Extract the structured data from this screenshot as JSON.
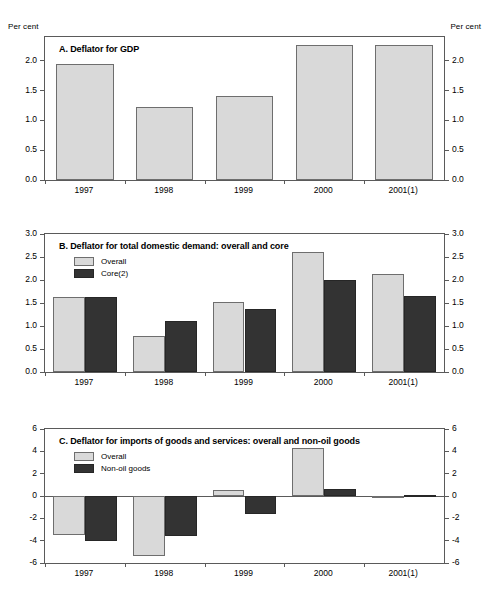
{
  "figure": {
    "unit_label_left": "Per cent",
    "unit_label_right": "Per cent"
  },
  "colors": {
    "series_light": "#d9d9d9",
    "series_dark": "#333333",
    "frame": "#5a5a5a",
    "background": "#ffffff"
  },
  "panel_a": {
    "title": "A. Deflator for GDP",
    "unit_left": "Per cent",
    "unit_right": "Per cent"
  },
  "panel_b": {
    "title": "B. Deflator for total domestic demand: overall and core",
    "legend": [
      {
        "label": "Overall",
        "style": "light"
      },
      {
        "label": "Core(2)",
        "style": "dark"
      }
    ]
  },
  "panel_c": {
    "title": "C. Deflator for imports of goods and services: overall and non-oil goods",
    "legend": [
      {
        "label": "Overall",
        "style": "light"
      },
      {
        "label": "Non-oil goods",
        "style": "dark"
      }
    ]
  },
  "chart_data": [
    {
      "type": "bar",
      "panel": "A",
      "title": "A. Deflator for GDP",
      "xlabel": "",
      "ylabel": "Per cent",
      "categories": [
        "1997",
        "1998",
        "1999",
        "2000",
        "2001(1)"
      ],
      "series": [
        {
          "name": "Deflator for GDP",
          "values": [
            1.95,
            1.23,
            1.41,
            2.27,
            2.27
          ]
        }
      ],
      "ylim": [
        0.0,
        2.4
      ],
      "yticks": [
        0.0,
        0.5,
        1.0,
        1.5,
        2.0
      ],
      "ytick_labels": [
        "0.0",
        "0.5",
        "1.0",
        "1.5",
        "2.0"
      ],
      "grid": false,
      "legend": "none"
    },
    {
      "type": "bar",
      "panel": "B",
      "title": "B. Deflator for total domestic demand: overall and core",
      "xlabel": "",
      "ylabel": "Per cent",
      "categories": [
        "1997",
        "1998",
        "1999",
        "2000",
        "2001(1)"
      ],
      "series": [
        {
          "name": "Overall",
          "values": [
            1.63,
            0.78,
            1.52,
            2.6,
            2.12
          ]
        },
        {
          "name": "Core(2)",
          "values": [
            1.63,
            1.1,
            1.38,
            2.01,
            1.65
          ]
        }
      ],
      "ylim": [
        0.0,
        3.0
      ],
      "yticks": [
        0.0,
        0.5,
        1.0,
        1.5,
        2.0,
        2.5,
        3.0
      ],
      "ytick_labels": [
        "0.0",
        "0.5",
        "1.0",
        "1.5",
        "2.0",
        "2.5",
        "3.0"
      ],
      "grid": false,
      "legend": "top-left"
    },
    {
      "type": "bar",
      "panel": "C",
      "title": "C. Deflator for imports of goods and services: overall and non-oil goods",
      "xlabel": "",
      "ylabel": "Per cent",
      "categories": [
        "1997",
        "1998",
        "1999",
        "2000",
        "2001(1)"
      ],
      "series": [
        {
          "name": "Overall",
          "values": [
            -3.5,
            -5.4,
            0.55,
            4.3,
            -0.15
          ]
        },
        {
          "name": "Non-oil goods",
          "values": [
            -4.0,
            -3.55,
            -1.65,
            0.6,
            0.1
          ]
        }
      ],
      "ylim": [
        -6,
        6
      ],
      "yticks": [
        -6,
        -4,
        -2,
        0,
        2,
        4,
        6
      ],
      "ytick_labels": [
        "-6",
        "-4",
        "-2",
        "0",
        "2",
        "4",
        "6"
      ],
      "grid": false,
      "legend": "top-left"
    }
  ]
}
